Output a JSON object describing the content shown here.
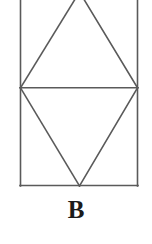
{
  "figure": {
    "caption": "B",
    "caption_label": "B",
    "background_color": "#ffffff",
    "stroke_color": "#5a5a5a",
    "stroke_width": 1.6,
    "geometry": {
      "rectangle": {
        "left": 20,
        "right": 138,
        "top": -6,
        "bottom": 186,
        "top_clipped": true
      },
      "midline": {
        "x1": 20,
        "y1": 88,
        "x2": 138,
        "y2": 88
      },
      "upper_triangle": {
        "apex": [
          80,
          -6
        ],
        "base_left": [
          20,
          88
        ],
        "base_right": [
          138,
          88
        ]
      },
      "lower_triangle": {
        "apex": [
          80,
          186
        ],
        "base_left": [
          20,
          88
        ],
        "base_right": [
          138,
          88
        ]
      },
      "vertices": {
        "left_mid": [
          20,
          88
        ],
        "right_mid": [
          138,
          88
        ],
        "bottom_apex": [
          80,
          186
        ],
        "top_apex": [
          80,
          -6
        ],
        "bottom_left": [
          20,
          186
        ],
        "bottom_right": [
          138,
          186
        ]
      }
    }
  }
}
